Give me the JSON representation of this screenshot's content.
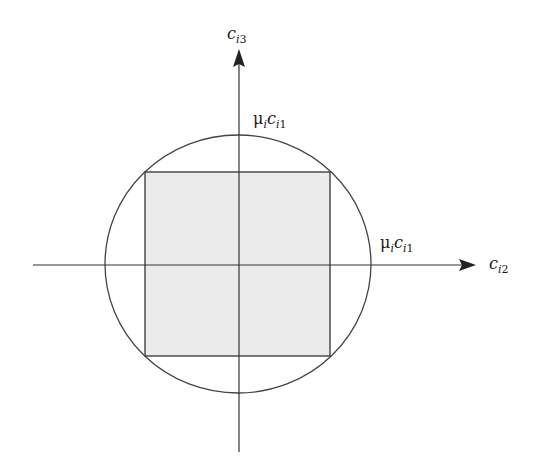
{
  "diagram": {
    "type": "geometry",
    "colors": {
      "background": "#ffffff",
      "stroke": "#333333",
      "square_fill": "#ebebeb"
    },
    "axes": {
      "vertical": {
        "label_main": "c",
        "label_sub_italic": "i",
        "label_sub_index": "3"
      },
      "horizontal": {
        "label_main": "c",
        "label_sub_italic": "i",
        "label_sub_index": "2"
      }
    },
    "radius_labels": {
      "top": {
        "mu": "μ",
        "mu_sub": "i",
        "c": "c",
        "c_sub_italic": "i",
        "c_sub_index": "1"
      },
      "right": {
        "mu": "μ",
        "mu_sub": "i",
        "c": "c",
        "c_sub_italic": "i",
        "c_sub_index": "1"
      }
    },
    "shapes": {
      "circle": "circle of radius μ_i c_i1 centered at origin",
      "square": "shaded square inscribed in circle"
    }
  }
}
